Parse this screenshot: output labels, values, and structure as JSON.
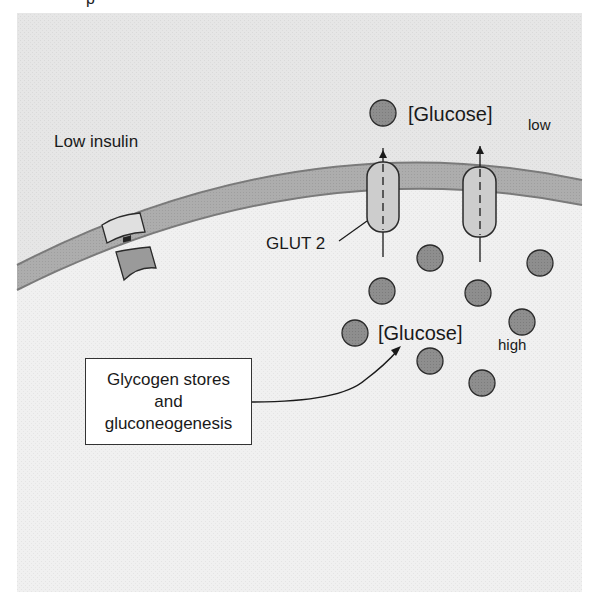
{
  "figure": {
    "top_fragment": "p",
    "condition_label": "Low insulin",
    "transporter_label": "GLUT 2",
    "glucose_outside": {
      "bracket_text": "[Glucose]",
      "subscript": "low"
    },
    "glucose_inside": {
      "bracket_text": "[Glucose]",
      "subscript": "high"
    },
    "source_box": {
      "lines": [
        "Glycogen stores",
        "and",
        "gluconeogenesis"
      ]
    },
    "colors": {
      "background_panel": "#e9e9e9",
      "intracellular": "#efefef",
      "membrane": "#a9a9a9",
      "membrane_edge": "#7a7a7a",
      "glucose_fill": "#8c8c8c",
      "transporter_fill": "#c8c8c8",
      "stroke": "#2a2a2a"
    },
    "glucose_molecules": {
      "outside": [
        [
          383,
          113
        ]
      ],
      "inside": [
        [
          430,
          258
        ],
        [
          382,
          291
        ],
        [
          478,
          293
        ],
        [
          540,
          263
        ],
        [
          522,
          322
        ],
        [
          355,
          333
        ],
        [
          430,
          361
        ],
        [
          482,
          383
        ]
      ]
    }
  }
}
